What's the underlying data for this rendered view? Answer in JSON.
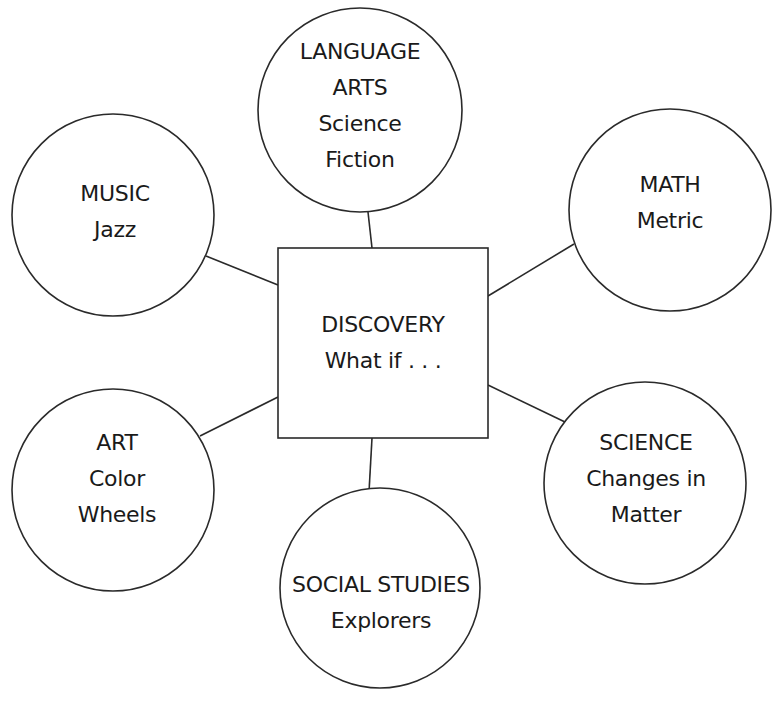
{
  "diagram": {
    "center": {
      "title": "DISCOVERY",
      "subtitle": "What if . . ."
    },
    "nodes": [
      {
        "id": "language-arts",
        "lines": [
          "LANGUAGE",
          "ARTS",
          "Science",
          "Fiction"
        ]
      },
      {
        "id": "music",
        "lines": [
          "MUSIC",
          "Jazz"
        ]
      },
      {
        "id": "math",
        "lines": [
          "MATH",
          "Metric"
        ]
      },
      {
        "id": "art",
        "lines": [
          "ART",
          "Color",
          "Wheels"
        ]
      },
      {
        "id": "science",
        "lines": [
          "SCIENCE",
          "Changes in",
          "Matter"
        ]
      },
      {
        "id": "social-studies",
        "lines": [
          "SOCIAL STUDIES",
          "Explorers"
        ]
      }
    ],
    "colors": {
      "stroke": "#2a2a2a",
      "background": "#ffffff",
      "text": "#1a1a1a"
    }
  }
}
